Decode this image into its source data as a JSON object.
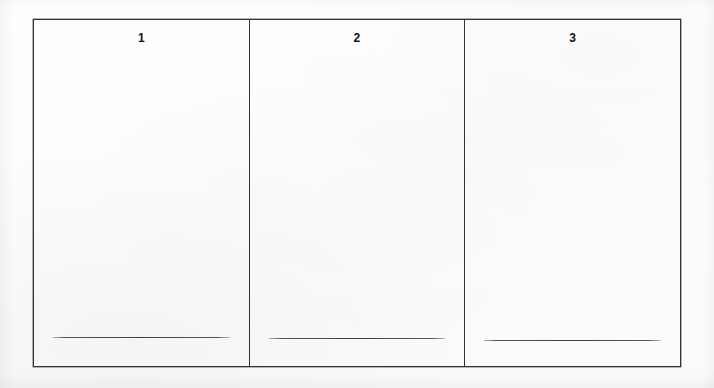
{
  "page": {
    "background_color": "#fdfdfc",
    "border_color": "#333333",
    "rule_color": "#404040",
    "text_color": "#111111"
  },
  "table": {
    "columns": [
      {
        "number": "1"
      },
      {
        "number": "2"
      },
      {
        "number": "3"
      }
    ]
  }
}
